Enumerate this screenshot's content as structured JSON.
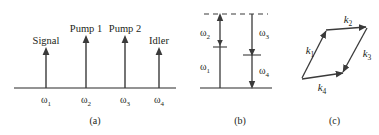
{
  "figure": {
    "type": "scientific-diagram",
    "panels": [
      {
        "id": "a",
        "caption": "(a)",
        "type": "frequency-spectrum",
        "axis_label": "",
        "lines": [
          {
            "label": "Signal",
            "tick": "ω",
            "tick_sub": "1",
            "x_frac": 0.25,
            "height_frac": 0.55
          },
          {
            "label": "Pump 1",
            "tick": "ω",
            "tick_sub": "2",
            "x_frac": 0.46,
            "height_frac": 0.78
          },
          {
            "label": "Pump 2",
            "tick": "ω",
            "tick_sub": "3",
            "x_frac": 0.67,
            "height_frac": 0.78
          },
          {
            "label": "Idler",
            "tick": "ω",
            "tick_sub": "4",
            "x_frac": 0.85,
            "height_frac": 0.55
          }
        ]
      },
      {
        "id": "b",
        "caption": "(b)",
        "type": "energy-level-diagram",
        "levels": [
          {
            "name": "ground-state-level",
            "style": "solid"
          },
          {
            "name": "virtual-level-upper",
            "style": "dashed"
          }
        ],
        "transitions": [
          {
            "label": "ω",
            "label_sub": "2",
            "direction": "up",
            "column": "left"
          },
          {
            "label": "ω",
            "label_sub": "1",
            "direction": "up",
            "column": "left"
          },
          {
            "label": "ω",
            "label_sub": "3",
            "direction": "down",
            "column": "right"
          },
          {
            "label": "ω",
            "label_sub": "4",
            "direction": "down",
            "column": "right"
          }
        ]
      },
      {
        "id": "c",
        "caption": "(c)",
        "type": "wave-vector-parallelogram",
        "vectors": [
          {
            "label": "k",
            "label_sub": "1",
            "direction": "up-right"
          },
          {
            "label": "k",
            "label_sub": "2",
            "direction": "right"
          },
          {
            "label": "k",
            "label_sub": "3",
            "direction": "down-left"
          },
          {
            "label": "k",
            "label_sub": "4",
            "direction": "right"
          }
        ]
      }
    ]
  },
  "colors": {
    "ink": "#231f20",
    "background": "#ffffff"
  }
}
